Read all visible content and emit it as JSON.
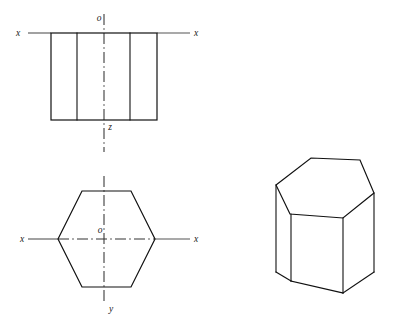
{
  "diagram": {
    "stroke_color": "#111111",
    "axis_color": "#555555",
    "center_line_color": "#333333",
    "background_color": "#ffffff"
  },
  "front_view": {
    "name": "front-view",
    "labels": {
      "axis_left": "x",
      "axis_right": "x",
      "origin": "o",
      "vertical_axis": "z"
    },
    "rectangle": {
      "x": 51,
      "y": 33,
      "width": 106,
      "height": 87
    },
    "internal_lines_x": [
      77,
      130
    ],
    "axis_y": 33,
    "axis_x_start": 28,
    "axis_x_end": 190,
    "center_x": 104,
    "center_line_top": 14,
    "center_line_bottom": 152
  },
  "top_view": {
    "name": "top-view",
    "labels": {
      "axis_left": "x",
      "axis_right": "x",
      "origin": "o",
      "vertical_axis": "y"
    },
    "hexagon_points": "58,239 82,191 131,191 155,239 131,287 82,287",
    "center_x": 104,
    "center_y": 239,
    "axis_x_start": 28,
    "axis_x_end": 190,
    "center_line_top": 176,
    "center_line_bottom": 302
  },
  "pictorial_view": {
    "name": "isometric-hexagonal-prism",
    "top_face_points": "276,185 311,158 360,160 374,193 343,218 290,214",
    "left_edge": {
      "x1": 276,
      "y1": 185,
      "x2": 276,
      "y2": 272
    },
    "middle_left_edge": {
      "x1": 291,
      "y1": 214,
      "x2": 291,
      "y2": 281
    },
    "front_edge": {
      "x1": 343,
      "y1": 218,
      "x2": 343,
      "y2": 293
    },
    "right_edge": {
      "x1": 374,
      "y1": 193,
      "x2": 374,
      "y2": 272
    },
    "bottom_left_path": "M276,272 L291,281",
    "bottom_front_left_path": "M291,281 L343,293",
    "bottom_front_right_path": "M343,293 L374,272"
  }
}
